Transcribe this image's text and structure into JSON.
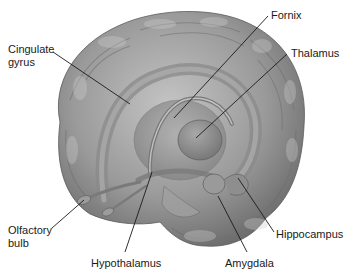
{
  "figure": {
    "labels": [
      {
        "id": "cingulate",
        "lines": [
          "Cingulate",
          "gyrus"
        ]
      },
      {
        "id": "fornix",
        "lines": [
          "Fornix"
        ]
      },
      {
        "id": "thalamus",
        "lines": [
          "Thalamus"
        ]
      },
      {
        "id": "olfactory",
        "lines": [
          "Olfactory",
          "bulb"
        ]
      },
      {
        "id": "hypothalamus",
        "lines": [
          "Hypothalamus"
        ]
      },
      {
        "id": "amygdala",
        "lines": [
          "Amygdala"
        ]
      },
      {
        "id": "hippocampus",
        "lines": [
          "Hippocampus"
        ]
      }
    ]
  },
  "colors": {
    "background": "#ffffff",
    "brain_light": "#b8b8b8",
    "brain_mid": "#8e8e8e",
    "brain_dark": "#5e5e5e",
    "leader_line": "#1a1a1a",
    "label_text": "#1a1a1a"
  }
}
